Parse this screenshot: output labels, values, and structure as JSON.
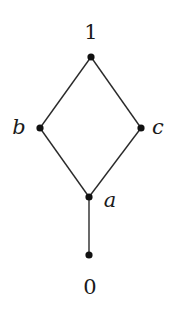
{
  "diagram": {
    "type": "hasse-diagram",
    "nodes": [
      {
        "id": "top",
        "label": "1",
        "x": 91,
        "y": 57,
        "label_x": 91,
        "label_y": 32,
        "italic": false
      },
      {
        "id": "b",
        "label": "b",
        "x": 40,
        "y": 128,
        "label_x": 19,
        "label_y": 127,
        "italic": true
      },
      {
        "id": "c",
        "label": "c",
        "x": 141,
        "y": 128,
        "label_x": 158,
        "label_y": 127,
        "italic": true
      },
      {
        "id": "a",
        "label": "a",
        "x": 89,
        "y": 197,
        "label_x": 110,
        "label_y": 200,
        "italic": true
      },
      {
        "id": "bottom",
        "label": "0",
        "x": 89,
        "y": 255,
        "label_x": 90,
        "label_y": 287,
        "italic": false
      }
    ],
    "edges": [
      {
        "from": "top",
        "to": "b"
      },
      {
        "from": "top",
        "to": "c"
      },
      {
        "from": "b",
        "to": "a"
      },
      {
        "from": "c",
        "to": "a"
      },
      {
        "from": "a",
        "to": "bottom"
      }
    ],
    "colors": {
      "edge": "#2a2a2a",
      "node": "#111111",
      "background": "#ffffff"
    }
  }
}
